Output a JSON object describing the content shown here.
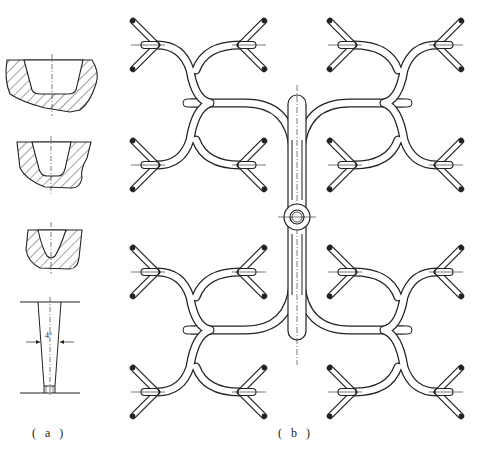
{
  "figure": {
    "panel_a_label": "( a )",
    "panel_b_label": "( b )",
    "angle_label": "4°"
  },
  "panel_a": {
    "description": "Sprue cup / pouring basin cross-sections (three hatched profiles) and tapered sprue",
    "sections": [
      "basin-section-1",
      "basin-section-2",
      "basin-section-3",
      "tapered-sprue"
    ],
    "taper_angle": "4°"
  },
  "panel_b": {
    "description": "Symmetric branching runner system with central sprue and 32 gate ingates",
    "central_sprue": "circular boss at center",
    "branch_groups": 4,
    "gates_per_group": 8
  },
  "colors": {
    "line": "#222222",
    "background": "#ffffff"
  }
}
